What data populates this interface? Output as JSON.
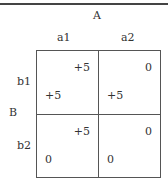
{
  "player_a": {
    "label": "A",
    "strategies": [
      "a1",
      "a2"
    ]
  },
  "player_b": {
    "label": "B",
    "strategies": [
      "b1",
      "b2"
    ]
  },
  "payoffs": [
    [
      {
        "a": "+5",
        "b": "+5"
      },
      {
        "a": "0",
        "b": "+5"
      }
    ],
    [
      {
        "a": "+5",
        "b": "0"
      },
      {
        "a": "0",
        "b": "0"
      }
    ]
  ]
}
